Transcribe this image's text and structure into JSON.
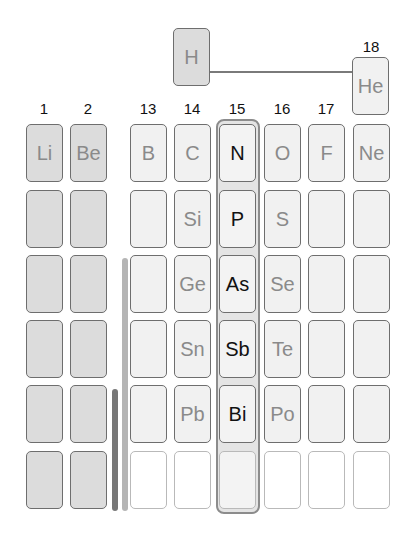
{
  "colors": {
    "s_block": "#dcdcdc",
    "p_block": "#f1f1f1",
    "highlight_border": "#8c8c8c",
    "bar_dark": "#777777",
    "bar_light": "#b5b5b5"
  },
  "groups": [
    "1",
    "2",
    "13",
    "14",
    "15",
    "16",
    "17",
    "18"
  ],
  "top": {
    "hydrogen": "H",
    "helium": "He"
  },
  "rows": [
    [
      "Li",
      "Be",
      "B",
      "C",
      "N",
      "O",
      "F",
      "Ne"
    ],
    [
      "",
      "",
      "",
      "Si",
      "P",
      "S",
      "",
      ""
    ],
    [
      "",
      "",
      "",
      "Ge",
      "As",
      "Se",
      "",
      ""
    ],
    [
      "",
      "",
      "",
      "Sn",
      "Sb",
      "Te",
      "",
      ""
    ],
    [
      "",
      "",
      "",
      "Pb",
      "Bi",
      "Po",
      "",
      ""
    ],
    [
      "",
      "",
      "",
      "",
      "",
      "",
      "",
      ""
    ]
  ],
  "highlighted_group": "15"
}
